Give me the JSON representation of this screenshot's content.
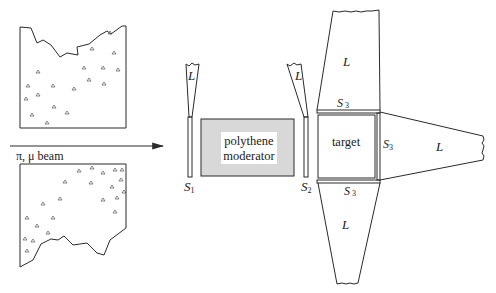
{
  "diagram": {
    "type": "experimental-setup",
    "beam": {
      "label": "π, μ beam",
      "direction": "left-to-right"
    },
    "shielding": {
      "top_block": "concrete shield (upper)",
      "bottom_block": "concrete shield (lower)"
    },
    "counters": {
      "s1": {
        "label": "S",
        "sub": "1"
      },
      "s2": {
        "label": "S",
        "sub": "2"
      },
      "s3_top": {
        "label": "S",
        "sub": "3"
      },
      "s3_right": {
        "label": "S",
        "sub": "3"
      },
      "s3_bottom": {
        "label": "S",
        "sub": "3"
      }
    },
    "light_guides": {
      "l_s1": "L",
      "l_s2": "L",
      "l_top": "L",
      "l_right": "L",
      "l_bottom": "L"
    },
    "moderator": {
      "line1": "polythene",
      "line2": "moderator",
      "fill": "#d8d8d8"
    },
    "target": {
      "label": "target"
    },
    "colors": {
      "line": "#2a2a2a",
      "moderator_fill": "#d8d8d8",
      "background": "#ffffff"
    }
  }
}
